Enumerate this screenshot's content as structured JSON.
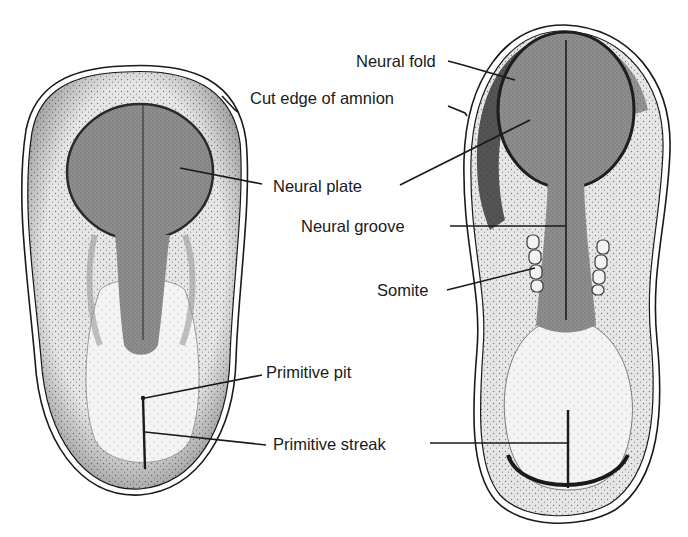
{
  "figure": {
    "left_embryo": {
      "description": "Embryo with neural plate and primitive streak (earlier stage)"
    },
    "right_embryo": {
      "description": "Embryo with neural folds, neural groove and somites (later stage)"
    }
  },
  "labels": {
    "neural_fold": "Neural fold",
    "cut_edge_of_amnion": "Cut edge of amnion",
    "neural_plate": "Neural plate",
    "neural_groove": "Neural groove",
    "somite": "Somite",
    "primitive_pit": "Primitive pit",
    "primitive_streak": "Primitive streak"
  },
  "colors": {
    "background": "#ffffff",
    "ink": "#1a1a1a",
    "neural_plate_fill": "#8a8a8a",
    "embryo_fill": "#d8d8d8",
    "caudal_fill": "#f0f0f0",
    "fold_dark": "#3a3a3a"
  }
}
